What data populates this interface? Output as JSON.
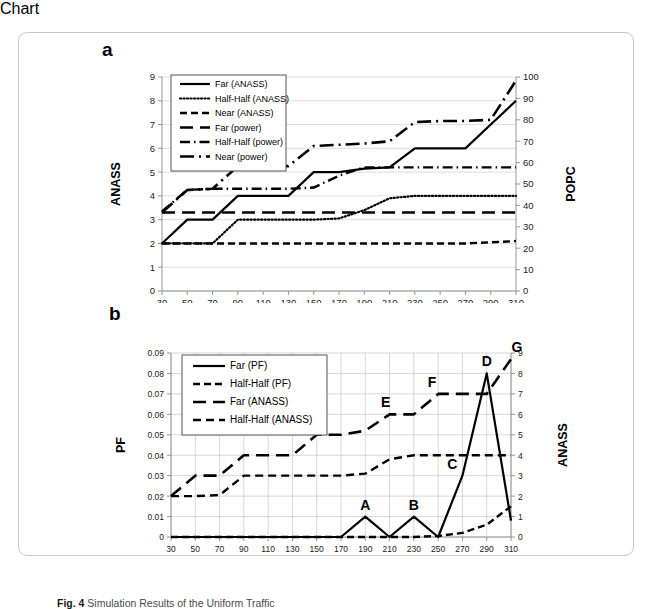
{
  "figure": {
    "caption_prefix": "Fig. 4",
    "caption_text": "Simulation Results of the Uniform Traffic"
  },
  "chart_data": [
    {
      "type": "line",
      "panel_label": "a",
      "title": "",
      "xlabel": "Traffic Rate for Each Traffic Source (Mbps)",
      "ylabel": "ANASS",
      "y2label": "POPC",
      "grid": true,
      "legend_position": "top-left",
      "x": [
        30,
        50,
        70,
        90,
        110,
        130,
        150,
        170,
        190,
        210,
        230,
        250,
        270,
        290,
        310
      ],
      "xticklabels": [
        "30",
        "50",
        "70",
        "90",
        "110",
        "130",
        "150",
        "170",
        "190",
        "210",
        "230",
        "250",
        "270",
        "290",
        "310"
      ],
      "ylim": [
        0,
        9
      ],
      "yticklabels": [
        "0",
        "1",
        "2",
        "3",
        "4",
        "5",
        "6",
        "7",
        "8",
        "9"
      ],
      "y2lim": [
        0,
        100
      ],
      "y2ticklabels": [
        "0",
        "10",
        "20",
        "30",
        "40",
        "50",
        "60",
        "70",
        "80",
        "90",
        "100"
      ],
      "series": [
        {
          "name": "Far (ANASS)",
          "style": "solid",
          "axis": "left",
          "values": [
            2.0,
            3.0,
            3.0,
            4.0,
            4.0,
            4.0,
            5.0,
            5.0,
            5.15,
            5.2,
            6.0,
            6.0,
            6.0,
            7.0,
            8.0
          ]
        },
        {
          "name": "Half-Half (ANASS)",
          "style": "dotted",
          "axis": "left",
          "values": [
            2.0,
            2.0,
            2.0,
            3.0,
            3.0,
            3.0,
            3.0,
            3.05,
            3.4,
            3.9,
            4.0,
            4.0,
            4.0,
            4.0,
            4.0
          ]
        },
        {
          "name": "Near (ANASS)",
          "style": "dashed",
          "axis": "left",
          "values": [
            2.0,
            2.0,
            2.0,
            2.0,
            2.0,
            2.0,
            2.0,
            2.0,
            2.0,
            2.0,
            2.0,
            2.0,
            2.0,
            2.05,
            2.1
          ]
        },
        {
          "name": "Far (power)",
          "style": "longdash",
          "axis": "left",
          "values": [
            3.3,
            3.3,
            3.3,
            3.3,
            3.3,
            3.3,
            3.3,
            3.3,
            3.3,
            3.3,
            3.3,
            3.3,
            3.3,
            3.3,
            3.3
          ]
        },
        {
          "name": "Half-Half (power)",
          "style": "dashdot",
          "axis": "left",
          "values": [
            3.35,
            4.25,
            4.3,
            4.3,
            4.3,
            4.3,
            4.35,
            4.85,
            5.2,
            5.2,
            5.2,
            5.2,
            5.2,
            5.2,
            5.2
          ]
        },
        {
          "name": "Near (power)",
          "style": "dashdotlong",
          "axis": "left",
          "values": [
            3.3,
            4.25,
            4.3,
            5.25,
            5.25,
            5.25,
            6.1,
            6.15,
            6.2,
            6.3,
            7.1,
            7.15,
            7.15,
            7.2,
            8.85
          ]
        }
      ]
    },
    {
      "type": "line",
      "panel_label": "b",
      "title": "",
      "xlabel": "Traffic Rate for Each Traffic Source (Mbps)",
      "ylabel": "PF",
      "y2label": "ANASS",
      "grid": true,
      "legend_position": "top-left",
      "x": [
        30,
        50,
        70,
        90,
        110,
        130,
        150,
        170,
        190,
        210,
        230,
        250,
        270,
        290,
        310
      ],
      "xticklabels": [
        "30",
        "50",
        "70",
        "90",
        "110",
        "130",
        "150",
        "170",
        "190",
        "210",
        "230",
        "250",
        "270",
        "290",
        "310"
      ],
      "ylim": [
        0,
        0.09
      ],
      "yticklabels": [
        "0",
        "0.01",
        "0.02",
        "0.03",
        "0.04",
        "0.05",
        "0.06",
        "0.07",
        "0.08",
        "0.09"
      ],
      "y2lim": [
        0,
        9
      ],
      "y2ticklabels": [
        "0",
        "1",
        "2",
        "3",
        "4",
        "5",
        "6",
        "7",
        "8",
        "9"
      ],
      "series": [
        {
          "name": "Far (PF)",
          "style": "solid",
          "axis": "left",
          "values": [
            0,
            0,
            0,
            0,
            0,
            0,
            0,
            0,
            0.01,
            0,
            0.01,
            0,
            0.03,
            0.08,
            0.008
          ]
        },
        {
          "name": "Half-Half (PF)",
          "style": "dashed",
          "axis": "left",
          "values": [
            0,
            0,
            0,
            0,
            0,
            0,
            0,
            0,
            0,
            0,
            0,
            0.0005,
            0.002,
            0.006,
            0.015
          ]
        },
        {
          "name": "Far (ANASS)",
          "style": "longdash",
          "axis": "right",
          "values": [
            2.0,
            3.0,
            3.0,
            4.0,
            4.0,
            4.0,
            5.0,
            5.0,
            5.2,
            6.0,
            6.0,
            7.0,
            7.0,
            7.0,
            8.7
          ]
        },
        {
          "name": "Half-Half (ANASS)",
          "style": "dashed2",
          "axis": "right",
          "values": [
            2.0,
            2.0,
            2.05,
            3.0,
            3.0,
            3.0,
            3.0,
            3.0,
            3.1,
            3.8,
            4.0,
            4.0,
            4.0,
            4.0,
            4.0
          ]
        }
      ],
      "annotations": [
        {
          "label": "A",
          "x": 190,
          "y": 0.01
        },
        {
          "label": "B",
          "x": 230,
          "y": 0.01
        },
        {
          "label": "C",
          "x": 270,
          "y": 0.03
        },
        {
          "label": "D",
          "x": 290,
          "y": 0.08
        },
        {
          "label": "E",
          "x": 210,
          "y": 6.0
        },
        {
          "label": "F",
          "x": 250,
          "y": 7.0
        },
        {
          "label": "G",
          "x": 310,
          "y": 8.7
        }
      ]
    }
  ]
}
